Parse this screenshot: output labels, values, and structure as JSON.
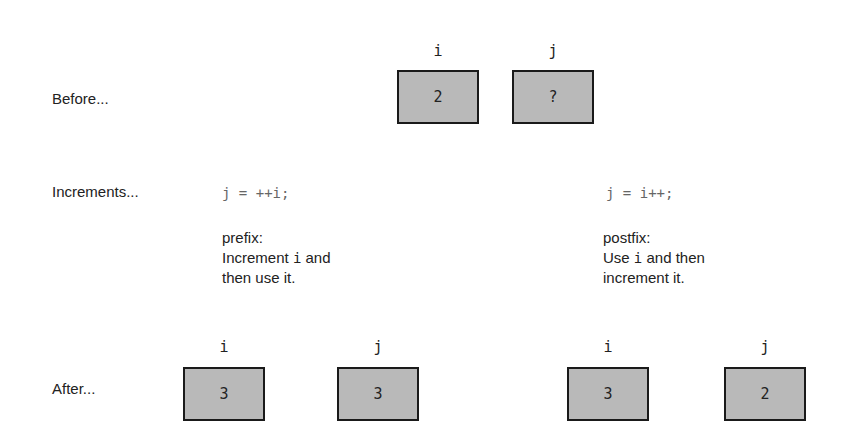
{
  "rows": {
    "before": "Before...",
    "increments": "Increments...",
    "after": "After..."
  },
  "before": {
    "i": {
      "name": "i",
      "value": "2"
    },
    "j": {
      "name": "j",
      "value": "?"
    }
  },
  "prefix": {
    "code": "j = ++i;",
    "title": "prefix:",
    "line1_pre": "Increment ",
    "line1_var": "i",
    "line1_post": " and",
    "line2": "then use it.",
    "after_i": {
      "name": "i",
      "value": "3"
    },
    "after_j": {
      "name": "j",
      "value": "3"
    }
  },
  "postfix": {
    "code": "j = i++;",
    "title": "postfix:",
    "line1_pre": "Use ",
    "line1_var": "i",
    "line1_post": " and then",
    "line2": "increment it.",
    "after_i": {
      "name": "i",
      "value": "3"
    },
    "after_j": {
      "name": "j",
      "value": "2"
    }
  },
  "colors": {
    "box_fill": "#b9b9b9",
    "box_border": "#1a1a1a",
    "code": "#666666"
  }
}
